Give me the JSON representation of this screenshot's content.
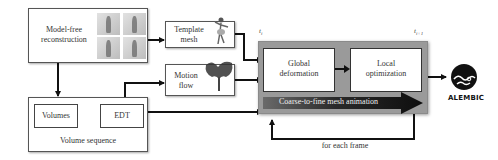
{
  "nodes": {
    "model_free": {
      "label_line1": "Model-free",
      "label_line2": "reconstruction",
      "thumbnails": 4
    },
    "template_mesh": {
      "label_line1": "Template",
      "label_line2": "mesh"
    },
    "motion_flow": {
      "label_line1": "Motion",
      "label_line2": "flow"
    },
    "volume_sequence": {
      "label": "Volume sequence",
      "volumes": "Volumes",
      "edt": "EDT"
    },
    "main_panel": {
      "t_start": "t",
      "t_start_sub": "i",
      "t_end": "t",
      "t_end_sub": "i+1",
      "global_line1": "Global",
      "global_line2": "deformation",
      "local_line1": "Local",
      "local_line2": "optimization",
      "band_label": "Coarse-to-fine mesh animation",
      "loop_label": "for each frame"
    },
    "output": {
      "logo_label": "ALEMBIC"
    }
  },
  "colors": {
    "panel_gray": "#9a9a9a",
    "arrow": "#111111",
    "band_dark": "#1a1a1a",
    "band_light": "#6a6a6a"
  }
}
